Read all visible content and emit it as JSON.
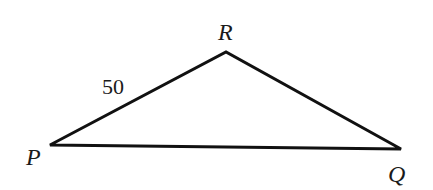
{
  "diagram": {
    "type": "triangle",
    "vertices": [
      {
        "name": "P",
        "x": 50,
        "y": 145,
        "label_x": 28,
        "label_y": 164
      },
      {
        "name": "R",
        "x": 226,
        "y": 52,
        "label_x": 218,
        "label_y": 40
      },
      {
        "name": "Q",
        "x": 401,
        "y": 149,
        "label_x": 389,
        "label_y": 181
      }
    ],
    "sides": [
      {
        "from": "P",
        "to": "R",
        "label": "50",
        "label_x": 102,
        "label_y": 94
      },
      {
        "from": "R",
        "to": "Q",
        "label": ""
      },
      {
        "from": "P",
        "to": "Q",
        "label": ""
      }
    ],
    "stroke_color": "#111111",
    "stroke_width": 3
  },
  "labels": {
    "P": "P",
    "R": "R",
    "Q": "Q",
    "side_PR": "50"
  }
}
